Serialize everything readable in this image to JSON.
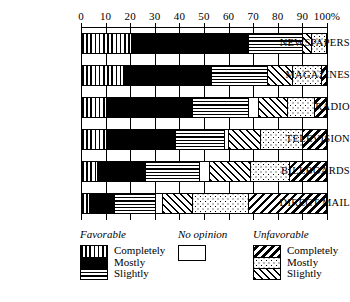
{
  "chart_data": {
    "type": "bar",
    "orientation": "horizontal",
    "stacked": true,
    "title": "",
    "xlabel": "",
    "ylabel": "",
    "xlim": [
      0,
      100
    ],
    "grid": true,
    "legend_position": "bottom",
    "axis": {
      "ticks": [
        0,
        10,
        20,
        30,
        40,
        50,
        60,
        70,
        80,
        90,
        100
      ],
      "tick_labels": [
        "0",
        "10",
        "20",
        "30",
        "40",
        "50",
        "60",
        "70",
        "80",
        "90",
        "100%"
      ]
    },
    "categories": [
      "NEWSPAPERS",
      "MAGAZINES",
      "RADIO",
      "TELEVISION",
      "BILLBOARDS",
      "DIRECT MAIL"
    ],
    "series": [
      {
        "name": "Favorable Completely",
        "pattern": "vertical-lines",
        "values": [
          20,
          17,
          10,
          10,
          6,
          3
        ]
      },
      {
        "name": "Favorable Mostly",
        "pattern": "solid-black",
        "values": [
          48,
          36,
          35,
          28,
          20,
          10
        ]
      },
      {
        "name": "Favorable Slightly",
        "pattern": "horizontal-lines",
        "values": [
          22,
          23,
          23,
          20,
          22,
          17
        ]
      },
      {
        "name": "No opinion",
        "pattern": "blank",
        "values": [
          0,
          0,
          4,
          2,
          4,
          3
        ]
      },
      {
        "name": "Unfavorable Slightly",
        "pattern": "diagonal-forward",
        "values": [
          4,
          10,
          12,
          13,
          17,
          12
        ]
      },
      {
        "name": "Unfavorable Mostly",
        "pattern": "dots",
        "values": [
          6,
          12,
          11,
          17,
          16,
          23
        ]
      },
      {
        "name": "Unfavorable Completely",
        "pattern": "diagonal-back",
        "values": [
          0,
          2,
          5,
          10,
          15,
          32
        ]
      }
    ]
  },
  "legend": {
    "groups": [
      {
        "title": "Favorable",
        "items": [
          {
            "label": "Completely",
            "pattern": "vertical-lines"
          },
          {
            "label": "Mostly",
            "pattern": "solid-black"
          },
          {
            "label": "Slightly",
            "pattern": "horizontal-lines"
          }
        ]
      },
      {
        "title": "No opinion",
        "items": [
          {
            "label": "",
            "pattern": "blank"
          }
        ]
      },
      {
        "title": "Unfavorable",
        "items": [
          {
            "label": "Completely",
            "pattern": "diagonal-back"
          },
          {
            "label": "Mostly",
            "pattern": "dots"
          },
          {
            "label": "Slightly",
            "pattern": "diagonal-forward"
          }
        ]
      }
    ]
  },
  "colors": {
    "ink": "#000000",
    "paper": "#ffffff"
  }
}
